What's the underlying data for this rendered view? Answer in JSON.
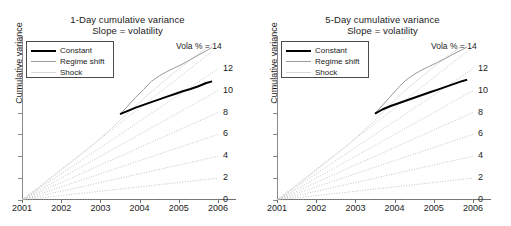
{
  "figure": {
    "ylabel": "Cumulative variance",
    "x_ticks": [
      "2001",
      "2002",
      "2003",
      "2004",
      "2005",
      "2006"
    ],
    "vola_header": "Vola % = 14",
    "right_labels": [
      "14",
      "12",
      "10",
      "8",
      "6",
      "4",
      "2",
      "0"
    ],
    "legend": [
      {
        "label": "Constant",
        "color": "#000000"
      },
      {
        "label": "Regime shift",
        "color": "#9a9a9a"
      },
      {
        "label": "Shock",
        "color": "#d8d8d8"
      }
    ]
  },
  "panels": [
    {
      "title_line1": "1-Day cumulative variance",
      "title_line2": "Slope = volatility"
    },
    {
      "title_line1": "5-Day cumulative variance",
      "title_line2": "Slope = volatility"
    }
  ],
  "chart_data": [
    {
      "type": "line",
      "title": "1-Day cumulative variance\nSlope = volatility",
      "xlabel": "",
      "ylabel": "Cumulative variance",
      "xlim": [
        2001,
        2006
      ],
      "ylim": [
        0,
        15
      ],
      "xticks": [
        2001,
        2002,
        2003,
        2004,
        2005,
        2006
      ],
      "right_axis_label": "Vola % = 14",
      "right_axis_ticks": [
        14,
        12,
        10,
        8,
        6,
        4,
        2,
        0
      ],
      "grid": false,
      "legend_position": "upper left",
      "reference_fan": {
        "description": "Dotted straight reference rays from the origin (2001, 0); each ray's slope equals the annualized volatility in percent, labelled at the right edge.",
        "style": "dotted",
        "color": "#b5b5b5",
        "origin": [
          2001,
          0
        ],
        "slopes_percent": [
          14,
          12,
          10,
          8,
          6,
          4,
          2,
          0
        ],
        "endpoints_at_2006": [
          14,
          12,
          10,
          8,
          6,
          4,
          2,
          0
        ]
      },
      "series": [
        {
          "name": "Constant",
          "color": "#000000",
          "width": 2,
          "x": [
            2003.5,
            2003.7,
            2003.9,
            2004.1,
            2004.3,
            2004.5,
            2004.7,
            2004.9,
            2005.1,
            2005.3,
            2005.5,
            2005.7,
            2005.85
          ],
          "values": [
            7.85,
            8.15,
            8.45,
            8.7,
            8.95,
            9.2,
            9.45,
            9.7,
            9.95,
            10.15,
            10.4,
            10.7,
            10.85
          ]
        },
        {
          "name": "Regime shift",
          "color": "#9a9a9a",
          "width": 1,
          "x": [
            2003.5,
            2003.7,
            2003.9,
            2004.1,
            2004.3,
            2004.5,
            2004.7,
            2004.9,
            2005.1,
            2005.3,
            2005.5,
            2005.7,
            2005.85
          ],
          "values": [
            7.85,
            8.6,
            9.4,
            10.1,
            10.85,
            11.35,
            11.75,
            12.1,
            12.45,
            12.85,
            13.25,
            13.65,
            13.95
          ]
        },
        {
          "name": "Shock",
          "color": "#e2e2e2",
          "width": 1,
          "x": [
            2001.0,
            2001.6,
            2002.2,
            2002.8,
            2003.2,
            2003.5,
            2003.8,
            2004.2,
            2004.6,
            2005.0,
            2005.4,
            2005.85
          ],
          "values": [
            0.0,
            1.6,
            3.3,
            5.0,
            6.3,
            7.3,
            8.3,
            9.6,
            10.8,
            12.0,
            13.1,
            14.3
          ]
        }
      ]
    },
    {
      "type": "line",
      "title": "5-Day cumulative variance\nSlope = volatility",
      "xlabel": "",
      "ylabel": "Cumulative variance",
      "xlim": [
        2001,
        2006
      ],
      "ylim": [
        0,
        15
      ],
      "xticks": [
        2001,
        2002,
        2003,
        2004,
        2005,
        2006
      ],
      "right_axis_label": "Vola % = 14",
      "right_axis_ticks": [
        14,
        12,
        10,
        8,
        6,
        4,
        2,
        0
      ],
      "grid": false,
      "legend_position": "upper left",
      "reference_fan": {
        "description": "Dotted straight reference rays from the origin (2001, 0); each ray's slope equals the annualized volatility in percent, labelled at the right edge.",
        "style": "dotted",
        "color": "#b5b5b5",
        "origin": [
          2001,
          0
        ],
        "slopes_percent": [
          14,
          12,
          10,
          8,
          6,
          4,
          2,
          0
        ],
        "endpoints_at_2006": [
          14,
          12,
          10,
          8,
          6,
          4,
          2,
          0
        ]
      },
      "series": [
        {
          "name": "Constant",
          "color": "#000000",
          "width": 2,
          "x": [
            2003.5,
            2003.7,
            2003.9,
            2004.1,
            2004.3,
            2004.5,
            2004.7,
            2004.9,
            2005.1,
            2005.3,
            2005.5,
            2005.7,
            2005.85
          ],
          "values": [
            7.9,
            8.3,
            8.6,
            8.85,
            9.1,
            9.35,
            9.6,
            9.85,
            10.1,
            10.35,
            10.6,
            10.85,
            11.0
          ]
        },
        {
          "name": "Regime shift",
          "color": "#9a9a9a",
          "width": 1,
          "x": [
            2003.5,
            2003.7,
            2003.9,
            2004.1,
            2004.3,
            2004.5,
            2004.7,
            2004.9,
            2005.1,
            2005.3,
            2005.5,
            2005.7,
            2005.85
          ],
          "values": [
            7.9,
            8.7,
            9.5,
            10.3,
            11.0,
            11.5,
            11.9,
            12.25,
            12.6,
            12.95,
            13.35,
            13.7,
            14.0
          ]
        },
        {
          "name": "Shock",
          "color": "#e2e2e2",
          "width": 1,
          "x": [
            2001.0,
            2001.6,
            2002.2,
            2002.8,
            2003.2,
            2003.5,
            2003.8,
            2004.2,
            2004.6,
            2005.0,
            2005.4,
            2005.85
          ],
          "values": [
            0.0,
            1.6,
            3.3,
            5.0,
            6.3,
            7.3,
            8.4,
            9.8,
            11.0,
            12.2,
            13.3,
            14.4
          ]
        }
      ]
    }
  ]
}
